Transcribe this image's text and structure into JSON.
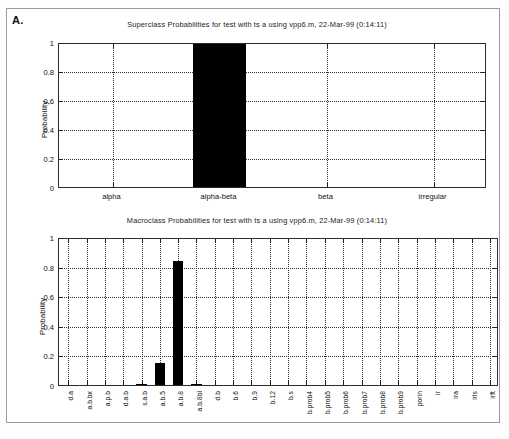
{
  "figure": {
    "panel_letter": "A."
  },
  "chart_data": [
    {
      "id": "superclass",
      "type": "bar",
      "title": "Superclass Probabilities for test with ts a using vpp6.m, 22-Mar-99 (0:14:11)",
      "xlabel": "",
      "ylabel": "Probability",
      "ylim": [
        0,
        1
      ],
      "yticks": [
        0,
        0.2,
        0.4,
        0.6,
        0.8,
        1
      ],
      "ytick_labels": [
        "0",
        "0.2",
        "0.4",
        "0.6",
        "0.8",
        "1"
      ],
      "grid": "horizontal-and-vertical-dotted",
      "legend": "none",
      "categories": [
        "alpha",
        "alpha-beta",
        "beta",
        "irregular"
      ],
      "values": [
        0,
        1,
        0,
        0
      ]
    },
    {
      "id": "macroclass",
      "type": "bar",
      "title": "Macroclass Probabilities for test with ts a using vpp6.m, 22-Mar-99 (0:14:11)",
      "xlabel": "",
      "ylabel": "Probability",
      "ylim": [
        0,
        1
      ],
      "yticks": [
        0,
        0.2,
        0.4,
        0.6,
        0.8,
        1
      ],
      "ytick_labels": [
        "0",
        "0.2",
        "0.4",
        "0.6",
        "0.8",
        "1"
      ],
      "grid": "horizontal-and-vertical-dotted",
      "legend": "none",
      "categories": [
        "d.a",
        "a.b.bx",
        "a.p.b",
        "d.a.b",
        "s.a.b",
        "a.b.5",
        "a.b.8",
        "a.b.8bl",
        "d.b",
        "b.6",
        "b.9",
        "b.12",
        "b.s",
        "b.prob4",
        "b.prob5",
        "b.prob6",
        "b.prob7",
        "b.prob8",
        "b.prob9",
        "porin",
        "ir",
        "ira",
        "irls",
        "irft"
      ],
      "values": [
        0,
        0,
        0,
        0,
        0.01,
        0.15,
        0.84,
        0.01,
        0,
        0,
        0,
        0,
        0,
        0,
        0,
        0,
        0,
        0,
        0,
        0,
        0,
        0,
        0,
        0
      ]
    }
  ]
}
